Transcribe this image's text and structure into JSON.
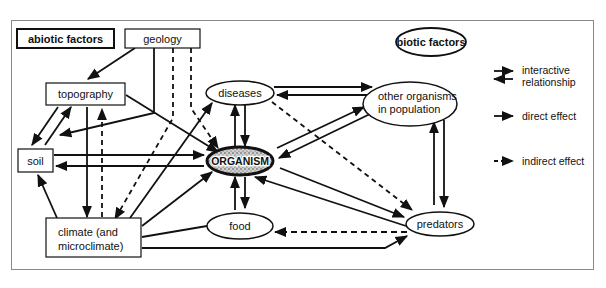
{
  "diagram": {
    "groups": {
      "abiotic": "abiotic factors",
      "biotic": "biotic factors"
    },
    "nodes": {
      "geology": "geology",
      "topography": "topography",
      "soil": "soil",
      "climate_line1": "climate (and",
      "climate_line2": "microclimate)",
      "diseases": "diseases",
      "organism": "ORGANISM",
      "other_line1": "other organisms",
      "other_line2": "in population",
      "food": "food",
      "predators": "predators"
    },
    "legend": {
      "interactive_line1": "interactive",
      "interactive_line2": "relationship",
      "direct": "direct effect",
      "indirect": "indirect effect"
    },
    "edges": [
      {
        "from": "geology",
        "to": "topography",
        "type": "direct"
      },
      {
        "from": "geology",
        "to": "soil",
        "type": "direct"
      },
      {
        "from": "geology",
        "to": "climate",
        "type": "indirect"
      },
      {
        "from": "geology",
        "to": "organism",
        "type": "indirect"
      },
      {
        "from": "topography",
        "to": "soil",
        "type": "interactive"
      },
      {
        "from": "topography",
        "to": "climate",
        "type": "direct"
      },
      {
        "from": "climate",
        "to": "topography",
        "type": "indirect"
      },
      {
        "from": "topography",
        "to": "organism",
        "type": "direct"
      },
      {
        "from": "soil",
        "to": "organism",
        "type": "interactive"
      },
      {
        "from": "climate",
        "to": "soil",
        "type": "direct"
      },
      {
        "from": "climate",
        "to": "diseases",
        "type": "direct"
      },
      {
        "from": "climate",
        "to": "organism",
        "type": "direct"
      },
      {
        "from": "climate",
        "to": "food",
        "type": "direct"
      },
      {
        "from": "climate",
        "to": "predators",
        "type": "direct"
      },
      {
        "from": "diseases",
        "to": "organism",
        "type": "interactive"
      },
      {
        "from": "diseases",
        "to": "other organisms",
        "type": "interactive"
      },
      {
        "from": "diseases",
        "to": "predators",
        "type": "indirect"
      },
      {
        "from": "other organisms",
        "to": "organism",
        "type": "interactive"
      },
      {
        "from": "other organisms",
        "to": "predators",
        "type": "interactive"
      },
      {
        "from": "organism",
        "to": "food",
        "type": "interactive"
      },
      {
        "from": "organism",
        "to": "predators",
        "type": "interactive"
      },
      {
        "from": "predators",
        "to": "food",
        "type": "indirect"
      }
    ]
  }
}
